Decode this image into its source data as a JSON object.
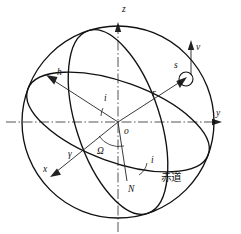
{
  "figure": {
    "type": "orbital-mechanics-diagram",
    "background_color": "#ffffff",
    "line_color": "#111111",
    "axis_color": "#555555"
  },
  "axes": {
    "z_label": "z",
    "y_label": "y",
    "x_label": "x",
    "origin_label": "o"
  },
  "vectors": {
    "h_label": "h",
    "r_label": "r",
    "v_label": "v"
  },
  "points": {
    "satellite_label": "s",
    "node_label": "N",
    "vernal_equinox_label": "γ"
  },
  "angles": {
    "inclination_center_label": "i",
    "inclination_node_label": "i",
    "raan_label": "Ω"
  },
  "curves": {
    "equator_label": "赤道"
  }
}
